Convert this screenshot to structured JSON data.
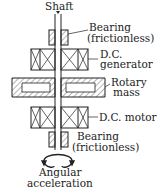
{
  "diagram": {
    "labels": {
      "shaft": "Shaft",
      "bearing_top_1": "Bearing",
      "bearing_top_2": "(frictionless)",
      "generator_1": "D.C.",
      "generator_2": "generator",
      "rotary_1": "Rotary",
      "rotary_2": "mass",
      "motor": "D.C. motor",
      "bearing_bottom_1": "Bearing",
      "bearing_bottom_2": "(frictionless)",
      "angular_1": "Angular",
      "angular_2": "acceleration"
    },
    "colors": {
      "line": "#222222",
      "background": "#ffffff"
    }
  }
}
